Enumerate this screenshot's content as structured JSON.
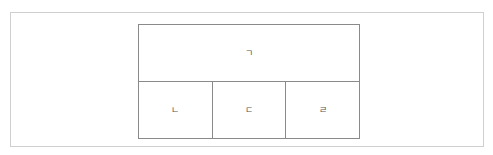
{
  "grid": {
    "top_row": [
      {
        "label": "ㄱ"
      }
    ],
    "bottom_row": [
      {
        "label": "ㄴ"
      },
      {
        "label": "ㄷ"
      },
      {
        "label": "ㄹ"
      }
    ]
  }
}
